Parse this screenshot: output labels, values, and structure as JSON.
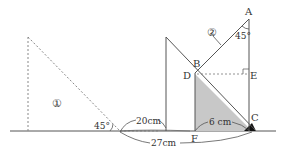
{
  "diagram": {
    "type": "geometry",
    "colors": {
      "line": "#555555",
      "dotted": "#888888",
      "shade": "#c8c8c8",
      "dark": "#111111"
    },
    "shapes": {
      "triangle_1_label": "①",
      "triangle_2_label": "②"
    },
    "points": {
      "A": "A",
      "B": "B",
      "C": "C",
      "D": "D",
      "E": "E",
      "F": "F"
    },
    "angles": {
      "angle_1": "45°",
      "angle_A": "45°"
    },
    "measurements": {
      "move_distance": "20cm",
      "fc_length": "6 cm",
      "total_length": "27cm"
    }
  }
}
